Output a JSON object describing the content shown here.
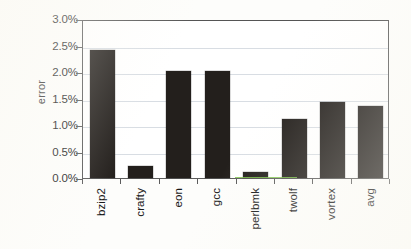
{
  "chart_data": {
    "type": "bar",
    "title": "",
    "xlabel": "",
    "ylabel": "error",
    "categories": [
      "bzip2",
      "crafty",
      "eon",
      "gcc",
      "perlbmk",
      "twolf",
      "vortex",
      "avg"
    ],
    "values": [
      2.42,
      0.22,
      2.01,
      2.02,
      0.11,
      1.12,
      1.44,
      1.36
    ],
    "value_unit": "%",
    "ylim": [
      0.0,
      3.0
    ],
    "ytick_values": [
      0.0,
      0.5,
      1.0,
      1.5,
      2.0,
      2.5,
      3.0
    ],
    "ytick_labels": [
      "0.0%",
      "0.5%",
      "1.0%",
      "1.5%",
      "2.0%",
      "2.5%",
      "3.0%"
    ],
    "grid": true,
    "grid_axis": "y",
    "legend": false,
    "legend_position": "none",
    "series": [
      {
        "name": "error",
        "values": [
          2.42,
          0.22,
          2.01,
          2.02,
          0.11,
          1.12,
          1.44,
          1.36
        ]
      }
    ]
  },
  "colors": {
    "bar": "#231f1c",
    "grid": "#d8dde3",
    "axis": "#5c5c5c",
    "text": "#1e1e1e",
    "plot_background": "#ffffff",
    "page_background": "#fdfdfb",
    "scan_artifact_green": "#7bc24a"
  }
}
